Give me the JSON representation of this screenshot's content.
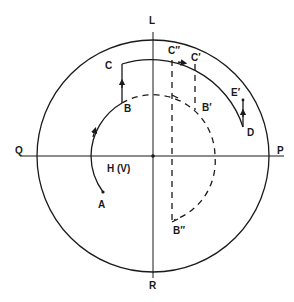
{
  "diagram": {
    "colors": {
      "stroke": "#1a1a1a",
      "background": "#ffffff"
    },
    "axes": {
      "top_label": "L",
      "bottom_label": "R",
      "left_label": "Q",
      "right_label": "P",
      "center_label": "H (V)"
    },
    "points": {
      "A": "A",
      "B": "B",
      "C": "C",
      "C_double_prime": "C″",
      "C_prime": "C′",
      "B_prime": "B′",
      "B_double_prime": "B″",
      "E_prime": "E′",
      "D": "D"
    }
  }
}
